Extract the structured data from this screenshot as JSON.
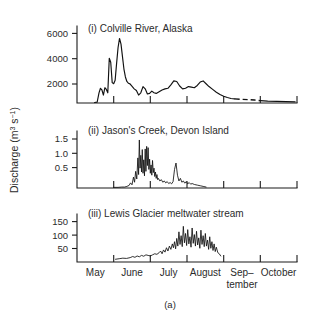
{
  "figure": {
    "caption": "(a)",
    "y_axis_title_main": "Discharge (m",
    "y_axis_title_sup1": "3",
    "y_axis_title_mid": " s",
    "y_axis_title_sup2": "−1",
    "y_axis_title_end": ")"
  },
  "chart_data": {
    "type": "line",
    "title": "(a)",
    "xlabel": "",
    "ylabel": "Discharge (m3 s-1)",
    "grid": false,
    "legend": "none",
    "shared_x": {
      "tick_labels": [
        "May",
        "June",
        "July",
        "August",
        "Sep–tember",
        "October"
      ],
      "tick_label_lines": [
        [
          "May"
        ],
        [
          "June"
        ],
        [
          "July"
        ],
        [
          "August"
        ],
        [
          "Sep–",
          "tember"
        ],
        [
          "October"
        ]
      ],
      "tick_positions_months": [
        0,
        1,
        2,
        3,
        4,
        5,
        6
      ],
      "range_months": [
        0,
        6
      ]
    },
    "panels": [
      {
        "id": "i",
        "label": "(i)",
        "title": "(i)  Colville River, Alaska",
        "name": "Colville River, Alaska",
        "ylim": [
          0,
          6800
        ],
        "yticks": [
          2000,
          4000,
          6000
        ],
        "ytick_labels": [
          "2000",
          "4000",
          "6000"
        ],
        "series": [
          {
            "name": "discharge-solid",
            "style": "solid",
            "x": [
              0.48,
              0.55,
              0.6,
              0.64,
              0.68,
              0.72,
              0.76,
              0.8,
              0.84,
              0.88,
              0.92,
              0.96,
              1.0,
              1.04,
              1.08,
              1.12,
              1.16,
              1.2,
              1.24,
              1.28,
              1.32,
              1.36,
              1.4,
              1.44,
              1.48,
              1.52,
              1.56,
              1.62,
              1.68,
              1.74,
              1.8,
              1.86,
              1.92,
              1.98,
              2.04,
              2.1,
              2.16,
              2.24,
              2.32,
              2.4,
              2.48,
              2.56,
              2.64,
              2.72,
              2.8,
              2.88,
              2.96,
              3.04,
              3.12,
              3.2,
              3.28,
              3.36,
              3.44,
              3.52,
              3.6,
              3.7,
              3.8,
              3.9,
              4.0,
              4.1,
              4.2,
              4.3
            ],
            "y": [
              40,
              80,
              900,
              1300,
              1150,
              700,
              1350,
              1200,
              900,
              3950,
              3600,
              1800,
              1700,
              2000,
              3500,
              4900,
              5700,
              5200,
              4100,
              3000,
              2300,
              1900,
              1750,
              1700,
              1550,
              1400,
              1250,
              1100,
              700,
              900,
              1450,
              1250,
              800,
              850,
              1050,
              900,
              850,
              1000,
              1150,
              1250,
              1300,
              1600,
              1950,
              1900,
              1500,
              1250,
              1300,
              1450,
              1400,
              1350,
              1550,
              1850,
              1950,
              1700,
              1450,
              1200,
              950,
              750,
              600,
              480,
              400,
              360
            ]
          },
          {
            "name": "discharge-dashed-extrapolated",
            "style": "dashed",
            "x": [
              4.3,
              4.48,
              4.66,
              4.84,
              5.0
            ],
            "y": [
              360,
              330,
              300,
              260,
              210
            ]
          },
          {
            "name": "discharge-solid-tail",
            "style": "solid",
            "x": [
              5.0,
              5.2,
              5.45,
              5.7,
              5.95
            ],
            "y": [
              210,
              170,
              140,
              120,
              100
            ]
          }
        ]
      },
      {
        "id": "ii",
        "label": "(ii)",
        "title": "(ii)  Jason's Creek, Devon Island",
        "name": "Jason's Creek, Devon Island",
        "ylim": [
          0,
          1.78
        ],
        "yticks": [
          0.5,
          1.0,
          1.5
        ],
        "ytick_labels": [
          "0.5",
          "1.0",
          "1.5"
        ],
        "series": [
          {
            "name": "discharge-solid",
            "style": "thin-solid",
            "x": [
              1.0,
              1.12,
              1.22,
              1.3,
              1.36,
              1.42,
              1.46,
              1.5,
              1.54,
              1.57,
              1.6,
              1.63,
              1.66,
              1.68,
              1.7,
              1.72,
              1.74,
              1.76,
              1.78,
              1.8,
              1.82,
              1.84,
              1.86,
              1.88,
              1.9,
              1.92,
              1.94,
              1.96,
              1.98,
              2.0,
              2.02,
              2.04,
              2.06,
              2.08,
              2.1,
              2.12,
              2.14,
              2.16,
              2.18,
              2.2,
              2.22,
              2.26,
              2.3,
              2.34,
              2.38,
              2.42,
              2.46,
              2.5,
              2.54,
              2.58,
              2.62,
              2.66,
              2.7,
              2.74,
              2.78,
              2.82,
              2.86,
              2.9,
              2.94,
              2.98,
              3.02,
              3.06,
              3.1,
              3.14,
              3.2,
              3.28,
              3.36,
              3.44,
              3.52
            ],
            "y": [
              0.02,
              0.02,
              0.03,
              0.03,
              0.05,
              0.08,
              0.16,
              0.1,
              0.34,
              0.18,
              0.52,
              0.28,
              0.94,
              0.42,
              1.5,
              0.62,
              1.02,
              0.5,
              1.2,
              0.46,
              0.88,
              0.38,
              1.22,
              0.52,
              1.3,
              0.7,
              1.26,
              0.58,
              0.9,
              0.46,
              0.72,
              0.4,
              0.86,
              0.48,
              0.62,
              0.36,
              0.5,
              0.3,
              0.42,
              0.26,
              0.3,
              0.22,
              0.26,
              0.18,
              0.22,
              0.16,
              0.2,
              0.14,
              0.17,
              0.13,
              0.2,
              0.58,
              0.78,
              0.4,
              0.22,
              0.3,
              0.18,
              0.22,
              0.15,
              0.2,
              0.13,
              0.17,
              0.12,
              0.14,
              0.11,
              0.09,
              0.07,
              0.05,
              0.03
            ]
          }
        ]
      },
      {
        "id": "iii",
        "label": "(iii)",
        "title": "(iii)  Lewis Glacier meltwater stream",
        "name": "Lewis Glacier meltwater stream",
        "ylim": [
          0,
          175
        ],
        "yticks": [
          50,
          100,
          150
        ],
        "ytick_labels": [
          "50",
          "100",
          "150"
        ],
        "series": [
          {
            "name": "discharge-solid",
            "style": "thin-solid",
            "x": [
              1.05,
              1.15,
              1.25,
              1.35,
              1.45,
              1.52,
              1.58,
              1.64,
              1.7,
              1.76,
              1.82,
              1.88,
              1.94,
              2.0,
              2.06,
              2.12,
              2.18,
              2.24,
              2.28,
              2.32,
              2.36,
              2.4,
              2.44,
              2.48,
              2.52,
              2.56,
              2.6,
              2.63,
              2.66,
              2.69,
              2.72,
              2.75,
              2.78,
              2.81,
              2.84,
              2.87,
              2.9,
              2.93,
              2.96,
              2.99,
              3.02,
              3.05,
              3.08,
              3.11,
              3.14,
              3.17,
              3.2,
              3.23,
              3.26,
              3.29,
              3.32,
              3.35,
              3.38,
              3.41,
              3.44,
              3.47,
              3.5,
              3.53,
              3.56,
              3.59,
              3.62,
              3.65,
              3.68,
              3.71,
              3.74,
              3.77,
              3.8,
              3.84,
              3.88,
              3.92
            ],
            "y": [
              10,
              12,
              14,
              13,
              16,
              20,
              17,
              22,
              19,
              24,
              21,
              26,
              24,
              22,
              26,
              30,
              28,
              34,
              40,
              30,
              44,
              36,
              52,
              40,
              58,
              46,
              66,
              52,
              74,
              48,
              86,
              58,
              110,
              64,
              96,
              56,
              130,
              70,
              104,
              60,
              118,
              66,
              92,
              54,
              124,
              68,
              100,
              58,
              112,
              62,
              88,
              50,
              116,
              64,
              96,
              56,
              104,
              58,
              80,
              46,
              92,
              50,
              74,
              42,
              66,
              38,
              54,
              34,
              30,
              22
            ]
          }
        ]
      }
    ]
  }
}
